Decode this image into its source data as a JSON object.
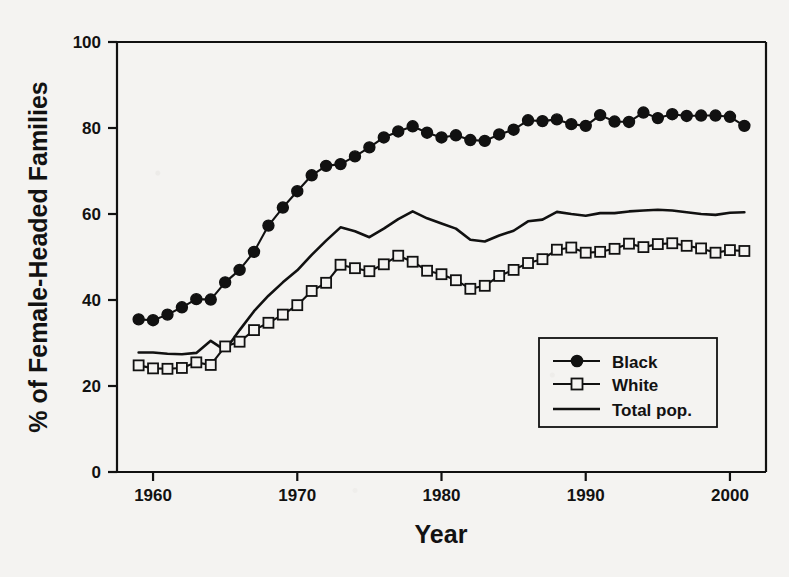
{
  "chart_data": {
    "type": "line",
    "title": "",
    "xlabel": "Year",
    "ylabel": "% of Female-Headed Families",
    "xlim": [
      1957.5,
      2002.5
    ],
    "ylim": [
      0,
      100
    ],
    "xticks": [
      1960,
      1970,
      1980,
      1990,
      2000
    ],
    "yticks": [
      0,
      20,
      40,
      60,
      80,
      100
    ],
    "grid": false,
    "legend_position": "inside-lower-right",
    "legend": [
      "Black",
      "White",
      "Total pop."
    ],
    "series": [
      {
        "name": "Black",
        "marker": "filled-circle",
        "color": "#111111",
        "x": [
          1959,
          1960,
          1961,
          1962,
          1963,
          1964,
          1965,
          1966,
          1967,
          1968,
          1969,
          1970,
          1971,
          1972,
          1973,
          1974,
          1975,
          1976,
          1977,
          1978,
          1979,
          1980,
          1981,
          1982,
          1983,
          1984,
          1985,
          1986,
          1987,
          1988,
          1989,
          1990,
          1991,
          1992,
          1993,
          1994,
          1995,
          1996,
          1997,
          1998,
          1999,
          2000,
          2001
        ],
        "y": [
          35.5,
          35.3,
          36.6,
          38.3,
          40.2,
          40.1,
          44.1,
          47.0,
          51.2,
          57.3,
          61.5,
          65.3,
          69.0,
          71.2,
          71.6,
          73.4,
          75.5,
          77.8,
          79.2,
          80.4,
          78.9,
          77.8,
          78.3,
          77.2,
          77.0,
          78.5,
          79.6,
          81.8,
          81.6,
          82.0,
          80.9,
          80.5,
          83.0,
          81.5,
          81.4,
          83.6,
          82.3,
          83.2,
          82.8,
          82.9,
          82.9,
          82.6,
          80.5
        ]
      },
      {
        "name": "White",
        "marker": "open-square",
        "color": "#111111",
        "x": [
          1959,
          1960,
          1961,
          1962,
          1963,
          1964,
          1965,
          1966,
          1967,
          1968,
          1969,
          1970,
          1971,
          1972,
          1973,
          1974,
          1975,
          1976,
          1977,
          1978,
          1979,
          1980,
          1981,
          1982,
          1983,
          1984,
          1985,
          1986,
          1987,
          1988,
          1989,
          1990,
          1991,
          1992,
          1993,
          1994,
          1995,
          1996,
          1997,
          1998,
          1999,
          2000,
          2001
        ],
        "y": [
          24.8,
          24.1,
          24.0,
          24.2,
          25.5,
          24.9,
          29.2,
          30.3,
          33.0,
          34.7,
          36.6,
          38.8,
          42.1,
          44.0,
          48.2,
          47.4,
          46.7,
          48.3,
          50.3,
          48.9,
          46.8,
          46.0,
          44.6,
          42.6,
          43.3,
          45.6,
          47.0,
          48.6,
          49.5,
          51.7,
          52.2,
          51.0,
          51.2,
          51.9,
          53.1,
          52.3,
          53.0,
          53.2,
          52.6,
          52.0,
          51.0,
          51.6,
          51.4
        ]
      },
      {
        "name": "Total pop.",
        "marker": "none",
        "color": "#111111",
        "x": [
          1959,
          1960,
          1961,
          1962,
          1963,
          1964,
          1965,
          1966,
          1967,
          1968,
          1969,
          1970,
          1971,
          1972,
          1973,
          1974,
          1975,
          1976,
          1977,
          1978,
          1979,
          1980,
          1981,
          1982,
          1983,
          1984,
          1985,
          1986,
          1987,
          1988,
          1989,
          1990,
          1991,
          1992,
          1993,
          1994,
          1995,
          1996,
          1997,
          1998,
          1999,
          2000,
          2001
        ],
        "y": [
          27.8,
          27.8,
          27.5,
          27.4,
          27.7,
          30.5,
          28.3,
          33.0,
          37.4,
          41.0,
          44.1,
          46.9,
          50.5,
          53.8,
          56.9,
          56.0,
          54.6,
          56.6,
          58.8,
          60.6,
          59.0,
          57.8,
          56.6,
          54.0,
          53.6,
          55.0,
          56.1,
          58.3,
          58.7,
          60.5,
          60.0,
          59.6,
          60.2,
          60.2,
          60.6,
          60.8,
          61.0,
          60.8,
          60.4,
          60.0,
          59.8,
          60.3,
          60.4
        ]
      }
    ]
  },
  "axes": {
    "y_tick_labels": [
      "0",
      "20",
      "40",
      "60",
      "80",
      "100"
    ],
    "x_tick_labels": [
      "1960",
      "1970",
      "1980",
      "1990",
      "2000"
    ],
    "x_axis_title": "Year",
    "y_axis_title": "% of Female-Headed Families"
  },
  "legend": {
    "entries": [
      {
        "label": "Black",
        "marker": "filled-circle"
      },
      {
        "label": "White",
        "marker": "open-square"
      },
      {
        "label": "Total pop.",
        "marker": "line"
      }
    ]
  },
  "colors": {
    "ink": "#111111",
    "paper": "#f4f3f1"
  }
}
